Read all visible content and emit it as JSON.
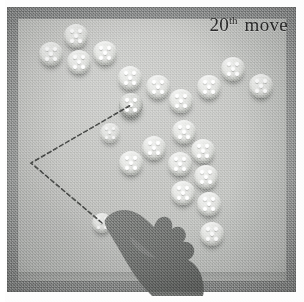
{
  "image": {
    "type": "photograph",
    "subject": "board-game-position",
    "width": 304,
    "height": 302
  },
  "caption": {
    "number": "20",
    "ordinal_suffix": "th",
    "word": "move"
  },
  "board": {
    "frame_color": "#989a99",
    "surface_color": "#cdcecb",
    "piece_color": "#e2e3e0",
    "dot_color": "#ffffff",
    "shadow_color": "#5a5c59",
    "dots_per_piece": 5,
    "dot_pattern": "quincunx"
  },
  "move_path": {
    "style": "dashed",
    "color": "#4a4c4a",
    "dash": "4 3",
    "width": 1.6,
    "vertex": {
      "x": 31,
      "y": 163
    },
    "from": {
      "x": 102,
      "y": 223
    },
    "to": {
      "x": 131,
      "y": 105
    },
    "label": ""
  },
  "pieces": [
    {
      "id": "p1",
      "x": 51,
      "y": 54,
      "state": "normal"
    },
    {
      "id": "p2",
      "x": 76,
      "y": 36,
      "state": "normal"
    },
    {
      "id": "p3",
      "x": 79,
      "y": 62,
      "state": "normal"
    },
    {
      "id": "p4",
      "x": 105,
      "y": 53,
      "state": "normal"
    },
    {
      "id": "p5",
      "x": 130,
      "y": 78,
      "state": "normal"
    },
    {
      "id": "p6",
      "x": 158,
      "y": 87,
      "state": "normal"
    },
    {
      "id": "p7",
      "x": 181,
      "y": 101,
      "state": "normal"
    },
    {
      "id": "p8",
      "x": 209,
      "y": 87,
      "state": "normal"
    },
    {
      "id": "p9",
      "x": 233,
      "y": 69,
      "state": "normal"
    },
    {
      "id": "p10",
      "x": 261,
      "y": 86,
      "state": "normal"
    },
    {
      "id": "p11",
      "x": 131,
      "y": 105,
      "state": "moving"
    },
    {
      "id": "p12",
      "x": 110,
      "y": 133,
      "state": "ghost"
    },
    {
      "id": "p13",
      "x": 184,
      "y": 132,
      "state": "normal"
    },
    {
      "id": "p14",
      "x": 154,
      "y": 148,
      "state": "normal"
    },
    {
      "id": "p15",
      "x": 203,
      "y": 151,
      "state": "normal"
    },
    {
      "id": "p16",
      "x": 131,
      "y": 163,
      "state": "normal"
    },
    {
      "id": "p17",
      "x": 206,
      "y": 177,
      "state": "normal"
    },
    {
      "id": "p18",
      "x": 180,
      "y": 164,
      "state": "normal"
    },
    {
      "id": "p19",
      "x": 209,
      "y": 204,
      "state": "normal"
    },
    {
      "id": "p20",
      "x": 183,
      "y": 193,
      "state": "normal"
    },
    {
      "id": "p21",
      "x": 212,
      "y": 234,
      "state": "normal"
    },
    {
      "id": "p22",
      "x": 102,
      "y": 223,
      "state": "ghost"
    }
  ],
  "hand": {
    "present": true,
    "description": "hand-silhouette",
    "color": "#6f7170",
    "pointing": "upper-left"
  }
}
